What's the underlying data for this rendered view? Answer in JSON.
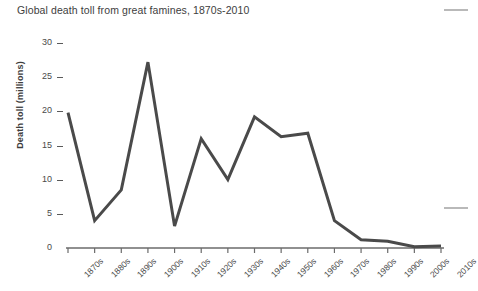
{
  "chart_data": {
    "type": "line",
    "title": "Global death toll from great famines, 1870s-2010",
    "xlabel": "",
    "ylabel": "Death toll (millions)",
    "categories": [
      "1870s",
      "1880s",
      "1890s",
      "1900s",
      "1910s",
      "1920s",
      "1930s",
      "1940s",
      "1950s",
      "1960s",
      "1970s",
      "1980s",
      "1990s",
      "2000s",
      "2010s"
    ],
    "values": [
      19.8,
      4.0,
      8.5,
      27.2,
      3.2,
      16.0,
      10.0,
      19.2,
      16.3,
      16.8,
      4.0,
      1.2,
      1.0,
      0.2,
      0.3
    ],
    "ylim": [
      0,
      30
    ],
    "yticks": [
      0,
      5,
      10,
      15,
      20,
      25,
      30
    ],
    "ytick_labels": [
      "0",
      "5",
      "10",
      "15",
      "20",
      "25",
      "30"
    ],
    "grid": false,
    "legend": false,
    "line_color": "#4a4a4a",
    "line_width": 3,
    "axis_color": "#6b6b6b"
  },
  "colors": {
    "background": "#ffffff",
    "text": "#3d3d3d",
    "line": "#4a4a4a",
    "axis": "#6b6b6b",
    "edge_marker": "#b9b9b9"
  }
}
